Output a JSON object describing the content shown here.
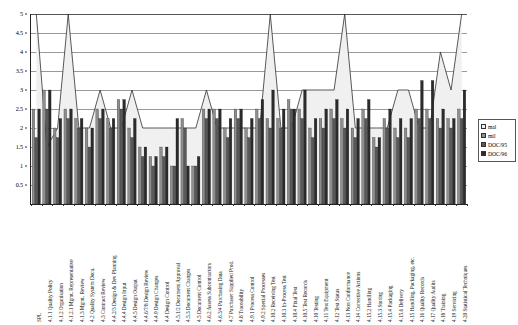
{
  "chart_data": {
    "type": "bar",
    "title": "",
    "xlabel": "",
    "ylabel": "",
    "ylim": [
      0,
      5
    ],
    "ytick_labels": [
      "0.5",
      "1",
      "1.5",
      "2",
      "2.5",
      "3",
      "3.5",
      "4",
      "4.5",
      "5"
    ],
    "ytick_values": [
      0.5,
      1,
      1.5,
      2,
      2.5,
      3,
      3.5,
      4,
      4.5,
      5
    ],
    "grid": true,
    "legend_position": "right",
    "categories": [
      "SPL",
      "4.1.1 Quality Policy",
      "4.1.2 Organisation",
      "4.1.2.1 Mgmt. Representative",
      "4.1.3 Mgmt. Review",
      "4.2 Quality System Docu.",
      "4.3 Contract Review",
      "4.4.2/3 Design & Dev Planning",
      "4.4.4 Design Input",
      "4.4.5 Design Output",
      "4.4.6/7/8 Design Review",
      "4.4.9 Design Changes",
      "4.4 Design Control",
      "4.5.1/2 Document Approval",
      "4.5.3 Document Changes",
      "4.5 Document Control",
      "4.6.2 Assess Subcontractors",
      "4.6.3/4 Purchasing Data",
      "4.7 Purchaser Supplied Prod.",
      "4.8 Traceability",
      "4.9.1 Process Control",
      "4.9.2 Special Processes",
      "4.10.2 Receiving Test",
      "4.10.3 In-Process Test",
      "4.10.4 Final Test",
      "4.10.5 Test Records",
      "4.10 Testing",
      "4.11 Test Equipment",
      "4.12 Test Status",
      "4.13 Non Conformance",
      "4.14 Corrective Actions",
      "4.15.2 Handling",
      "4.15.3 Storing",
      "4.15.4 Packaging",
      "4.15.6 Delivery",
      "4.15 Handling, Packaging, etc.",
      "4.16 Quality Records",
      "4.17 Quality Audits",
      "4.18 Training",
      "4.19 Servicing",
      "4.20 Statistical Techniques"
    ],
    "series": [
      {
        "name": "mal",
        "kind": "line",
        "color": "#f0f0f0",
        "line_color": "#303030",
        "values": [
          5,
          1.5,
          2,
          5,
          2,
          2,
          3,
          2,
          2,
          3,
          2,
          2,
          2,
          2,
          2,
          2,
          3,
          2,
          2,
          2,
          2,
          2,
          5,
          2,
          2,
          3,
          3,
          3,
          3,
          5,
          2,
          2,
          2,
          2,
          3,
          3,
          2,
          2,
          4,
          3,
          5
        ]
      },
      {
        "name": "mil",
        "kind": "bar",
        "color": "#8e8e8e",
        "values": [
          2.5,
          3,
          2,
          2.5,
          2.25,
          2,
          2.5,
          2.25,
          2.75,
          2,
          1.5,
          1.25,
          1.5,
          1,
          2.25,
          1,
          2.5,
          2.5,
          2,
          2.5,
          2,
          2.5,
          2.25,
          2.25,
          2.75,
          2.5,
          2,
          2.25,
          2.5,
          2.25,
          2,
          2.5,
          1.75,
          2.25,
          2,
          2,
          2.5,
          2.5,
          2.25,
          2.25,
          2.5
        ]
      },
      {
        "name": "DOC/95",
        "kind": "bar",
        "color": "#595959",
        "values": [
          1.75,
          2.5,
          1.75,
          2.25,
          2,
          1.5,
          2.25,
          2,
          2.5,
          1.75,
          1.25,
          1,
          1.25,
          1,
          2,
          1,
          2.25,
          2.25,
          1.75,
          2.25,
          1.75,
          2.25,
          2,
          2,
          2.5,
          2.25,
          1.75,
          2,
          2.25,
          2,
          1.75,
          2.25,
          1.5,
          2,
          1.75,
          1.75,
          2.25,
          2.25,
          2,
          2,
          2.25
        ]
      },
      {
        "name": "DOC/96",
        "kind": "bar",
        "color": "#2b2b2b",
        "values": [
          2.5,
          3,
          2.25,
          2.5,
          2.25,
          2,
          2.5,
          2.25,
          2.75,
          2.25,
          1.5,
          1.25,
          1.5,
          2.25,
          1,
          1.25,
          2.5,
          2.5,
          2.25,
          2.5,
          2.25,
          2.75,
          3,
          2.5,
          2.5,
          3,
          2.25,
          2.5,
          2.75,
          2.5,
          2.25,
          2.75,
          1.75,
          2.5,
          2.25,
          2.25,
          3.25,
          3.25,
          2.5,
          2.25,
          3
        ]
      }
    ]
  },
  "legend": {
    "entries": [
      {
        "label": "mal",
        "swatch": "#f0f0f0"
      },
      {
        "label": "mil",
        "swatch": "#8e8e8e"
      },
      {
        "label": "DOC/95",
        "swatch": "#595959"
      },
      {
        "label": "DOC/96",
        "swatch": "#2b2b2b"
      }
    ]
  }
}
